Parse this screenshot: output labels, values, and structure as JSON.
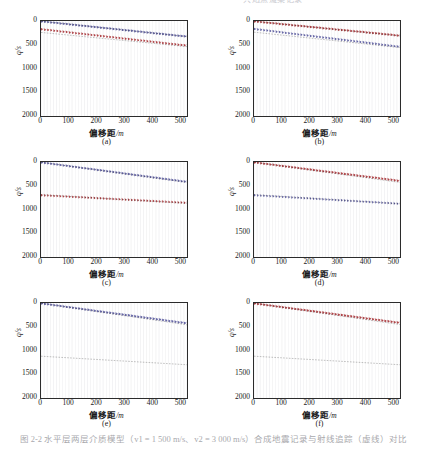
{
  "figure": {
    "top_cut_text": "共炮点道集记录",
    "caption": "图 2-2 水平层两层介质模型（v1 = 1 500 m/s、v2 = 3 000 m/s）合成地震记录与射线追踪（虚线）对比",
    "panel_count": 6
  },
  "axis": {
    "x_label_zh": "偏移距",
    "x_label_unit": "/m",
    "y_label": "q/s",
    "x_ticks": [
      "0",
      "100",
      "200",
      "300",
      "400",
      "500"
    ],
    "y_ticks": [
      "0",
      "500",
      "1000",
      "1500",
      "2000"
    ],
    "xlim": [
      0,
      520
    ],
    "ylim": [
      0,
      2000
    ]
  },
  "colors": {
    "trace": "#8f8f99",
    "blue_event": "#5b5b9e",
    "red_event": "#a8353a",
    "dashed": "#111111",
    "axis": "#2b2b2b",
    "background": "#ffffff"
  },
  "panels": [
    {
      "id": "a",
      "label": "(a)",
      "events": [
        {
          "name": "blue-direct-wave",
          "color": "#5b5b9e",
          "t0": 10,
          "t_end": 330,
          "amp": 46
        },
        {
          "name": "red-reflection",
          "color": "#a8353a",
          "t0": 175,
          "t_end": 520,
          "amp": 40
        }
      ],
      "dashed": [
        {
          "name": "direct-ray",
          "t0": 5,
          "t_end": 330
        },
        {
          "name": "reflected-ray",
          "t0": 240,
          "t_end": 540
        }
      ]
    },
    {
      "id": "b",
      "label": "(b)",
      "events": [
        {
          "name": "red-direct-wave",
          "color": "#a8353a",
          "t0": 10,
          "t_end": 310,
          "amp": 44
        },
        {
          "name": "blue-reflection",
          "color": "#5b5b9e",
          "t0": 170,
          "t_end": 545,
          "amp": 40
        }
      ],
      "dashed": [
        {
          "name": "direct-ray",
          "t0": 5,
          "t_end": 315
        },
        {
          "name": "reflected-ray",
          "t0": 235,
          "t_end": 560
        }
      ]
    },
    {
      "id": "c",
      "label": "(c)",
      "events": [
        {
          "name": "blue-direct-wave",
          "color": "#5b5b9e",
          "t0": 10,
          "t_end": 420,
          "amp": 44
        },
        {
          "name": "red-reflection",
          "color": "#a8353a",
          "t0": 700,
          "t_end": 860,
          "amp": 34
        }
      ],
      "dashed": [
        {
          "name": "direct-ray",
          "t0": 5,
          "t_end": 430
        },
        {
          "name": "reflected-ray",
          "t0": 690,
          "t_end": 870
        }
      ]
    },
    {
      "id": "d",
      "label": "(d)",
      "events": [
        {
          "name": "red-direct-wave",
          "color": "#a8353a",
          "t0": 10,
          "t_end": 400,
          "amp": 44
        },
        {
          "name": "blue-reflection",
          "color": "#5b5b9e",
          "t0": 700,
          "t_end": 880,
          "amp": 32
        }
      ],
      "dashed": [
        {
          "name": "direct-ray",
          "t0": 5,
          "t_end": 430
        },
        {
          "name": "reflected-ray",
          "t0": 690,
          "t_end": 880
        }
      ]
    },
    {
      "id": "e",
      "label": "(e)",
      "events": [
        {
          "name": "blue-direct-wave",
          "color": "#5b5b9e",
          "t0": 10,
          "t_end": 430,
          "amp": 46
        }
      ],
      "dashed": [
        {
          "name": "direct-ray",
          "t0": 5,
          "t_end": 460
        },
        {
          "name": "reflected-ray",
          "t0": 1120,
          "t_end": 1300
        }
      ]
    },
    {
      "id": "f",
      "label": "(f)",
      "events": [
        {
          "name": "red-direct-wave",
          "color": "#a8353a",
          "t0": 10,
          "t_end": 420,
          "amp": 46
        }
      ],
      "dashed": [
        {
          "name": "direct-ray",
          "t0": 5,
          "t_end": 455
        },
        {
          "name": "reflected-ray",
          "t0": 1120,
          "t_end": 1300
        }
      ]
    }
  ],
  "chart_data": {
    "type": "line",
    "xlabel": "偏移距/m",
    "ylabel": "q/s",
    "xlim": [
      0,
      520
    ],
    "ylim": [
      0,
      2000
    ],
    "grid": false,
    "legend": null,
    "categories": [
      "(a)",
      "(b)",
      "(c)",
      "(d)",
      "(e)",
      "(f)"
    ],
    "x": [
      0,
      100,
      200,
      300,
      400,
      500
    ],
    "series": [
      {
        "name": "a-blue-direct-wave",
        "values": [
          10,
          74,
          138,
          202,
          266,
          330
        ]
      },
      {
        "name": "a-red-reflection",
        "values": [
          175,
          244,
          313,
          382,
          451,
          520
        ]
      },
      {
        "name": "b-red-direct-wave",
        "values": [
          10,
          70,
          130,
          190,
          250,
          310
        ]
      },
      {
        "name": "b-blue-reflection",
        "values": [
          170,
          245,
          320,
          395,
          470,
          545
        ]
      },
      {
        "name": "c-blue-direct-wave",
        "values": [
          10,
          92,
          174,
          256,
          338,
          420
        ]
      },
      {
        "name": "c-red-reflection",
        "values": [
          700,
          732,
          764,
          796,
          828,
          860
        ]
      },
      {
        "name": "d-red-direct-wave",
        "values": [
          10,
          88,
          166,
          244,
          322,
          400
        ]
      },
      {
        "name": "d-blue-reflection",
        "values": [
          700,
          736,
          772,
          808,
          844,
          880
        ]
      },
      {
        "name": "e-blue-direct-wave",
        "values": [
          10,
          94,
          178,
          262,
          346,
          430
        ]
      },
      {
        "name": "e-dashed-reflected",
        "values": [
          1120,
          1156,
          1192,
          1228,
          1264,
          1300
        ]
      },
      {
        "name": "f-red-direct-wave",
        "values": [
          10,
          92,
          174,
          256,
          338,
          420
        ]
      },
      {
        "name": "f-dashed-reflected",
        "values": [
          1120,
          1156,
          1192,
          1228,
          1264,
          1300
        ]
      }
    ]
  }
}
